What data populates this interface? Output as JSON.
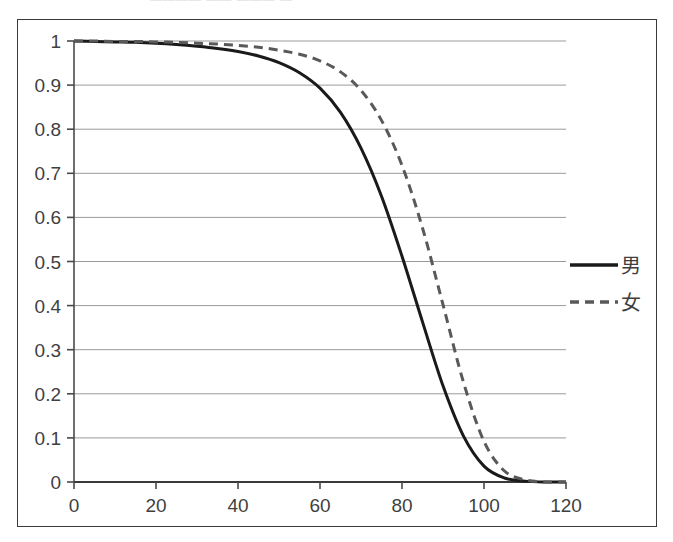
{
  "title_fragment": "———— —— ——— —",
  "chart_data": {
    "type": "line",
    "title": "",
    "subtitle": "",
    "xlabel": "",
    "ylabel": "",
    "xlim": [
      0,
      120
    ],
    "ylim": [
      0,
      1
    ],
    "grid": true,
    "grid_axis": "y",
    "legend_position": "right",
    "x_ticks": [
      0,
      20,
      40,
      60,
      80,
      100,
      120
    ],
    "x_tick_labels": [
      "0",
      "20",
      "40",
      "60",
      "80",
      "100",
      "120"
    ],
    "y_ticks": [
      0,
      0.1,
      0.2,
      0.3,
      0.4,
      0.5,
      0.6,
      0.7,
      0.8,
      0.9,
      1
    ],
    "y_tick_labels": [
      "0",
      "0.1",
      "0.2",
      "0.3",
      "0.4",
      "0.5",
      "0.6",
      "0.7",
      "0.8",
      "0.9",
      "1"
    ],
    "x": [
      0,
      5,
      10,
      15,
      20,
      25,
      30,
      35,
      40,
      45,
      50,
      55,
      60,
      65,
      70,
      75,
      80,
      85,
      90,
      95,
      100,
      105,
      110,
      115,
      120
    ],
    "series": [
      {
        "name": "男",
        "label": "男",
        "style": "solid",
        "color": "#1a1a1a",
        "width": 3,
        "values": [
          1.0,
          0.999,
          0.998,
          0.997,
          0.995,
          0.992,
          0.988,
          0.983,
          0.976,
          0.966,
          0.951,
          0.928,
          0.893,
          0.838,
          0.757,
          0.648,
          0.512,
          0.363,
          0.218,
          0.104,
          0.036,
          0.009,
          0.002,
          0.0,
          0.0
        ]
      },
      {
        "name": "女",
        "label": "女",
        "style": "dashed",
        "color": "#595959",
        "width": 3,
        "values": [
          1.0,
          1.0,
          0.999,
          0.999,
          0.998,
          0.997,
          0.995,
          0.993,
          0.99,
          0.986,
          0.979,
          0.97,
          0.955,
          0.93,
          0.888,
          0.82,
          0.718,
          0.576,
          0.402,
          0.226,
          0.092,
          0.025,
          0.005,
          0.0,
          0.0
        ]
      }
    ]
  },
  "legend": {
    "items": [
      {
        "label": "男",
        "style": "solid",
        "color": "#1a1a1a"
      },
      {
        "label": "女",
        "style": "dashed",
        "color": "#595959"
      }
    ]
  }
}
